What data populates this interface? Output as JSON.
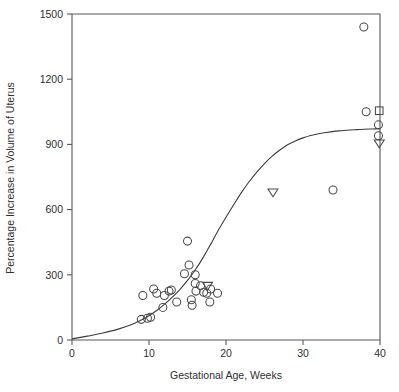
{
  "chart_data": {
    "type": "scatter",
    "title": "",
    "xlabel": "Gestational Age, Weeks",
    "ylabel": "Percentage Increase in Volume of Uterus",
    "xlim": [
      0,
      40
    ],
    "ylim": [
      0,
      1500
    ],
    "xticks": [
      0,
      10,
      20,
      30,
      40
    ],
    "xtick_labels": [
      "0",
      "10",
      "20",
      "30",
      "40"
    ],
    "yticks": [
      0,
      300,
      600,
      900,
      1200,
      1500
    ],
    "ytick_labels": [
      "0",
      "300",
      "600",
      "900",
      "1200",
      "1500"
    ],
    "grid": false,
    "legend": "none",
    "series": [
      {
        "name": "circle-markers",
        "marker": "circle",
        "points": [
          [
            9.0,
            95
          ],
          [
            9.2,
            205
          ],
          [
            9.8,
            100
          ],
          [
            10.2,
            105
          ],
          [
            10.6,
            235
          ],
          [
            11.0,
            215
          ],
          [
            11.8,
            150
          ],
          [
            12.0,
            205
          ],
          [
            12.6,
            225
          ],
          [
            12.9,
            230
          ],
          [
            13.6,
            175
          ],
          [
            14.6,
            305
          ],
          [
            15.0,
            455
          ],
          [
            15.2,
            345
          ],
          [
            15.5,
            185
          ],
          [
            15.6,
            160
          ],
          [
            16.0,
            300
          ],
          [
            16.0,
            260
          ],
          [
            16.1,
            225
          ],
          [
            16.7,
            250
          ],
          [
            17.1,
            220
          ],
          [
            17.5,
            215
          ],
          [
            17.9,
            175
          ],
          [
            18.0,
            235
          ],
          [
            18.9,
            215
          ],
          [
            33.9,
            690
          ],
          [
            37.9,
            1440
          ],
          [
            38.2,
            1050
          ],
          [
            39.8,
            990
          ],
          [
            39.8,
            940
          ]
        ]
      },
      {
        "name": "triangle-markers",
        "marker": "triangle-down",
        "points": [
          [
            17.6,
            250
          ],
          [
            26.1,
            680
          ],
          [
            39.9,
            905
          ]
        ]
      },
      {
        "name": "square-markers",
        "marker": "square",
        "points": [
          [
            39.9,
            1055
          ]
        ]
      }
    ],
    "fit_curve": {
      "name": "sigmoid-fit",
      "description": "logistic fit of percentage increase vs gestational age",
      "points": [
        [
          0,
          5
        ],
        [
          2,
          18
        ],
        [
          4,
          32
        ],
        [
          6,
          50
        ],
        [
          8,
          75
        ],
        [
          9,
          92
        ],
        [
          10,
          112
        ],
        [
          11,
          136
        ],
        [
          12,
          164
        ],
        [
          13,
          196
        ],
        [
          14,
          232
        ],
        [
          15,
          274
        ],
        [
          16,
          322
        ],
        [
          17,
          378
        ],
        [
          18,
          440
        ],
        [
          19,
          505
        ],
        [
          20,
          565
        ],
        [
          21,
          622
        ],
        [
          22,
          678
        ],
        [
          23,
          728
        ],
        [
          24,
          772
        ],
        [
          25,
          812
        ],
        [
          26,
          846
        ],
        [
          27,
          874
        ],
        [
          28,
          898
        ],
        [
          29,
          916
        ],
        [
          30,
          930
        ],
        [
          31,
          941
        ],
        [
          32,
          949
        ],
        [
          33,
          955
        ],
        [
          34,
          960
        ],
        [
          35,
          963
        ],
        [
          36,
          966
        ],
        [
          37,
          968
        ],
        [
          38,
          970
        ],
        [
          39,
          971
        ],
        [
          40,
          972
        ]
      ]
    }
  }
}
